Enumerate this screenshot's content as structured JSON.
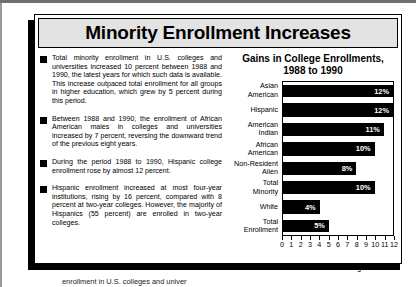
{
  "panel": {
    "title": "Minority Enrollment Increases"
  },
  "bullets": [
    {
      "text": "Total minority enrollment in U.S. colleges and universities increased 10 percent between 1988 and 1990, the latest years for which such data is available.  This increase outpaced total enrollment for all groups in higher education, which grew by 5 percent during this period."
    },
    {
      "text": "Between 1988 and 1990, the enrollment of African American males in colleges and universities increased by 7 percent, reversing the downward trend of the previous eight years."
    },
    {
      "text": "During the period 1988 to 1990, Hispanic college enrollment rose by almost 12 percent."
    },
    {
      "text": "Hispanic enrollment increased at most four-year institutions, rising by 16 percent, compared with 8 percent at two-year colleges.  However, the majority of Hispanics (55 percent) are enrolled in two-year colleges."
    }
  ],
  "footer": {
    "text": "enrollment in U.S. colleges and univer"
  },
  "chart_data": {
    "type": "bar",
    "orientation": "horizontal",
    "title": "Gains in College Enrollments,",
    "title_line2": "1988 to 1990",
    "xlabel": "Percent Change",
    "ylabel": "",
    "xlim": [
      0,
      12
    ],
    "xticks": [
      0,
      1,
      2,
      3,
      4,
      5,
      6,
      7,
      8,
      9,
      10,
      11,
      12
    ],
    "grid": false,
    "legend": "none",
    "categories": [
      "Asian American",
      "Hispanic",
      "American Indian",
      "African American",
      "Non-Resident Alien",
      "Total Minority",
      "White",
      "Total Enrollment"
    ],
    "category_lines": [
      [
        "Asian",
        "American"
      ],
      [
        "Hispanic"
      ],
      [
        "American",
        "Indian"
      ],
      [
        "African",
        "American"
      ],
      [
        "Non-Resident",
        "Alien"
      ],
      [
        "Total",
        "Minority"
      ],
      [
        "White"
      ],
      [
        "Total",
        "Enrollment"
      ]
    ],
    "values": [
      12,
      12,
      11,
      10,
      8,
      10,
      4,
      5
    ],
    "value_labels": [
      "12%",
      "12%",
      "11%",
      "10%",
      "8%",
      "10%",
      "4%",
      "5%"
    ]
  }
}
